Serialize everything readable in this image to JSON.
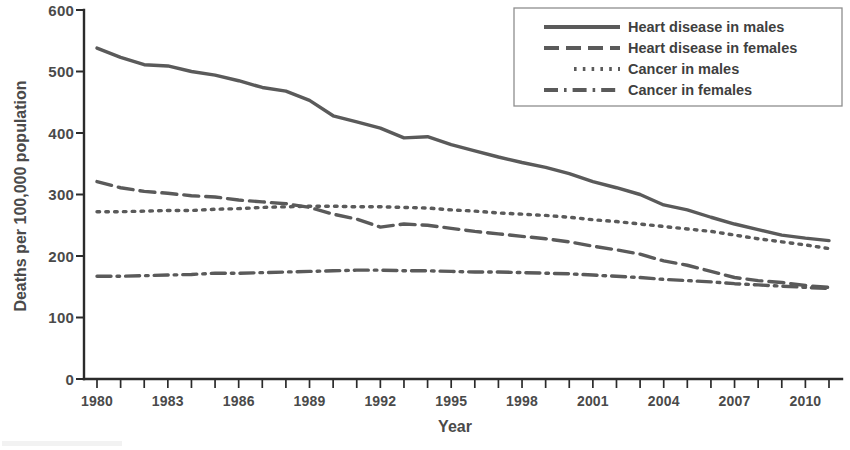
{
  "chart_data": {
    "type": "line",
    "title": "",
    "subtitle": "",
    "xlabel": "Year",
    "ylabel": "Deaths per 100,000 population",
    "xlim": [
      1980,
      2011
    ],
    "ylim": [
      0,
      600
    ],
    "grid": false,
    "legend_position": "top-right",
    "y_ticks": [
      0,
      100,
      200,
      300,
      400,
      500,
      600
    ],
    "y_tick_labels": [
      "0",
      "100",
      "200",
      "300",
      "400",
      "500",
      "600"
    ],
    "x_ticks": [
      1980,
      1981,
      1982,
      1983,
      1984,
      1985,
      1986,
      1987,
      1988,
      1989,
      1990,
      1991,
      1992,
      1993,
      1994,
      1995,
      1996,
      1997,
      1998,
      1999,
      2000,
      2001,
      2002,
      2003,
      2004,
      2005,
      2006,
      2007,
      2008,
      2009,
      2010,
      2011
    ],
    "x_tick_labels": [
      "1980",
      "1983",
      "1986",
      "1989",
      "1992",
      "1995",
      "1998",
      "2001",
      "2004",
      "2007",
      "2010"
    ],
    "x_labeled_ticks": [
      1980,
      1983,
      1986,
      1989,
      1992,
      1995,
      1998,
      2001,
      2004,
      2007,
      2010
    ],
    "x": [
      1980,
      1981,
      1982,
      1983,
      1984,
      1985,
      1986,
      1987,
      1988,
      1989,
      1990,
      1991,
      1992,
      1993,
      1994,
      1995,
      1996,
      1997,
      1998,
      1999,
      2000,
      2001,
      2002,
      2003,
      2004,
      2005,
      2006,
      2007,
      2008,
      2009,
      2010,
      2011
    ],
    "series": [
      {
        "name": "Heart disease in males",
        "dash": "solid",
        "color": "#5a5a5a",
        "values": [
          538,
          523,
          511,
          509,
          500,
          494,
          485,
          474,
          468,
          453,
          428,
          418,
          408,
          392,
          394,
          381,
          371,
          361,
          352,
          344,
          334,
          321,
          311,
          300,
          283,
          275,
          263,
          252,
          243,
          234,
          229,
          225
        ]
      },
      {
        "name": "Heart disease in females",
        "dash": "dashed",
        "color": "#5a5a5a",
        "values": [
          321,
          311,
          305,
          302,
          298,
          296,
          291,
          288,
          285,
          279,
          268,
          260,
          247,
          252,
          250,
          245,
          240,
          236,
          232,
          228,
          223,
          216,
          210,
          203,
          192,
          185,
          175,
          165,
          160,
          157,
          152,
          149
        ]
      },
      {
        "name": "Cancer in males",
        "dash": "dotted",
        "color": "#5a5a5a",
        "values": [
          272,
          272,
          273,
          274,
          274,
          276,
          277,
          279,
          280,
          281,
          281,
          280,
          280,
          279,
          278,
          275,
          273,
          270,
          268,
          266,
          263,
          259,
          256,
          252,
          248,
          244,
          240,
          234,
          228,
          223,
          218,
          212
        ]
      },
      {
        "name": "Cancer in females",
        "dash": "dashdot",
        "color": "#5a5a5a",
        "values": [
          167,
          167,
          168,
          169,
          170,
          172,
          172,
          173,
          174,
          175,
          176,
          177,
          177,
          176,
          176,
          175,
          174,
          174,
          173,
          172,
          171,
          169,
          167,
          165,
          162,
          160,
          158,
          155,
          153,
          151,
          149,
          147
        ]
      }
    ]
  },
  "legend": {
    "entries": [
      {
        "label": "Heart disease in males"
      },
      {
        "label": "Heart disease in females"
      },
      {
        "label": "Cancer in males"
      },
      {
        "label": "Cancer in females"
      }
    ]
  },
  "axes": {
    "x_title": "Year",
    "y_title": "Deaths per 100,000 population"
  }
}
